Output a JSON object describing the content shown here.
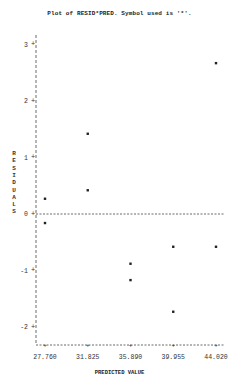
{
  "chart_data": {
    "type": "scatter",
    "title": "Plot of RESID*PRED.  Symbol used is '*'.",
    "xlabel": "PREDICTED VALUE",
    "ylabel": "RESIDUALS",
    "x_ticks": [
      "27.760",
      "31.825",
      "35.890",
      "39.955",
      "44.020"
    ],
    "y_ticks": [
      "3",
      "2",
      "1",
      "0",
      "-1",
      "-2"
    ],
    "xlim": [
      27.76,
      44.02
    ],
    "ylim": [
      -2.3,
      3.3
    ],
    "reference_line": 0,
    "symbol": "*",
    "points": [
      {
        "x": 27.76,
        "y": 0.27
      },
      {
        "x": 27.76,
        "y": -0.16
      },
      {
        "x": 31.825,
        "y": 1.42
      },
      {
        "x": 31.825,
        "y": 0.42
      },
      {
        "x": 35.89,
        "y": -0.88
      },
      {
        "x": 35.89,
        "y": -1.17
      },
      {
        "x": 39.955,
        "y": -0.58
      },
      {
        "x": 39.955,
        "y": -1.73
      },
      {
        "x": 44.02,
        "y": 2.67
      },
      {
        "x": 44.02,
        "y": -0.58
      }
    ]
  }
}
